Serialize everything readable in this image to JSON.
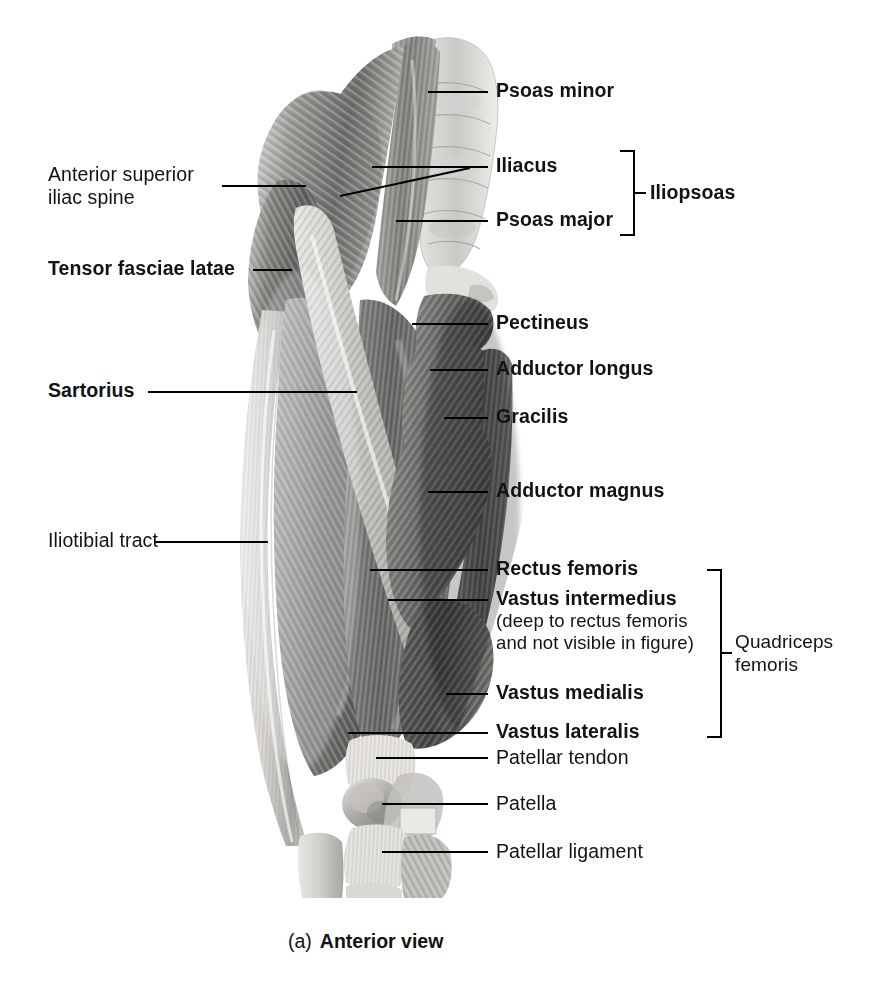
{
  "figure": {
    "caption_prefix": "(a)",
    "caption_title": "Anterior view",
    "view": "Anterior view of thigh musculature"
  },
  "labels_left": [
    {
      "id": "anterior-superior-iliac-spine",
      "line1": "Anterior superior",
      "line2": "iliac spine",
      "weight": "regular"
    },
    {
      "id": "tensor-fasciae-latae",
      "line1": "Tensor fasciae latae",
      "weight": "bold"
    },
    {
      "id": "sartorius",
      "line1": "Sartorius",
      "weight": "bold"
    },
    {
      "id": "iliotibial-tract",
      "line1": "Iliotibial tract",
      "weight": "regular"
    }
  ],
  "labels_right": [
    {
      "id": "psoas-minor",
      "text": "Psoas minor",
      "weight": "bold"
    },
    {
      "id": "iliacus",
      "text": "Iliacus",
      "weight": "bold"
    },
    {
      "id": "psoas-major",
      "text": "Psoas major",
      "weight": "bold"
    },
    {
      "id": "pectineus",
      "text": "Pectineus",
      "weight": "bold"
    },
    {
      "id": "adductor-longus",
      "text": "Adductor longus",
      "weight": "bold"
    },
    {
      "id": "gracilis",
      "text": "Gracilis",
      "weight": "bold"
    },
    {
      "id": "adductor-magnus",
      "text": "Adductor magnus",
      "weight": "bold"
    },
    {
      "id": "rectus-femoris",
      "text": "Rectus femoris",
      "weight": "bold"
    },
    {
      "id": "vastus-intermedius",
      "text": "Vastus intermedius",
      "weight": "bold"
    },
    {
      "id": "vastus-medialis",
      "text": "Vastus medialis",
      "weight": "bold"
    },
    {
      "id": "vastus-lateralis",
      "text": "Vastus lateralis",
      "weight": "bold"
    },
    {
      "id": "patellar-tendon",
      "text": "Patellar tendon",
      "weight": "regular"
    },
    {
      "id": "patella",
      "text": "Patella",
      "weight": "regular"
    },
    {
      "id": "patellar-ligament",
      "text": "Patellar ligament",
      "weight": "regular"
    }
  ],
  "annotations": {
    "vastus_intermedius_note_line1": "(deep to rectus femoris",
    "vastus_intermedius_note_line2": "and not visible in figure)"
  },
  "group_brackets": [
    {
      "id": "iliopsoas",
      "label": "Iliopsoas",
      "members": [
        "Iliacus",
        "Psoas major"
      ]
    },
    {
      "id": "quadriceps-femoris",
      "label_line1": "Quadriceps",
      "label_line2": "femoris",
      "members": [
        "Rectus femoris",
        "Vastus intermedius",
        "Vastus medialis",
        "Vastus lateralis"
      ]
    }
  ],
  "colors": {
    "text": "#121212",
    "leader_line": "#000000",
    "background": "#ffffff",
    "muscle_dark": "#5c5c5c",
    "muscle_mid": "#8e8e8e",
    "muscle_light": "#c9c9c9",
    "tendon": "#e6e4e1"
  }
}
